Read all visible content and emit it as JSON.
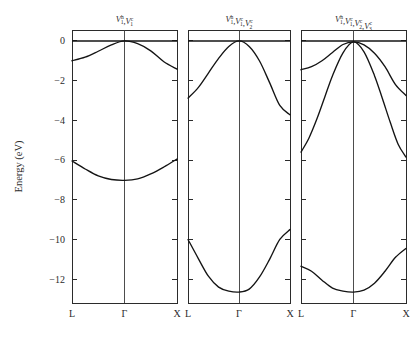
{
  "figure": {
    "ylabel": "Energy (eV)",
    "background_color": "#ffffff",
    "line_color": "#141414",
    "axis_color": "#2b2b2b"
  },
  "chart_data": {
    "type": "line",
    "title": "",
    "xlabel": "",
    "ylabel": "Energy (eV)",
    "ylim": [
      -13.2,
      0.55
    ],
    "yticks": [
      0,
      -2,
      -4,
      -6,
      -8,
      -10,
      -12
    ],
    "yticklabels": [
      "0",
      "-2",
      "-4",
      "-6",
      "-8",
      "-10",
      "-12"
    ],
    "xticks": [
      0,
      1,
      2
    ],
    "xticklabels": [
      "L",
      "Γ",
      "X"
    ],
    "grid": false,
    "legend": "none",
    "panels": [
      {
        "id": "panel-1",
        "title_parts": [
          {
            "sym": "V",
            "sup": "h",
            "sub": "1"
          },
          {
            "sym": "V",
            "sup": "c",
            "sub": "1"
          }
        ],
        "title_text": "V1h,V1c",
        "series": [
          {
            "name": "flat-band",
            "x": [
              0,
              1,
              2
            ],
            "values": [
              0.0,
              0.0,
              0.0
            ]
          },
          {
            "name": "upper-valence-band",
            "x": [
              0,
              0.25,
              0.5,
              0.75,
              1,
              1.25,
              1.5,
              1.75,
              2
            ],
            "values": [
              -1.0,
              -0.82,
              -0.52,
              -0.2,
              0.0,
              -0.14,
              -0.5,
              -1.05,
              -1.42
            ]
          },
          {
            "name": "lower-valence-band",
            "x": [
              0,
              0.25,
              0.5,
              0.75,
              1,
              1.25,
              1.5,
              1.75,
              2
            ],
            "values": [
              -6.05,
              -6.45,
              -6.8,
              -6.98,
              -7.02,
              -6.95,
              -6.7,
              -6.35,
              -5.95
            ]
          }
        ]
      },
      {
        "id": "panel-2",
        "title_parts": [
          {
            "sym": "V",
            "sup": "h",
            "sub": "1"
          },
          {
            "sym": "V",
            "sup": "c",
            "sub": "1"
          },
          {
            "sym": "V",
            "sup": "c",
            "sub": "2"
          }
        ],
        "title_text": "V1h,V1c,V2c",
        "series": [
          {
            "name": "flat-band",
            "x": [
              0,
              1,
              2
            ],
            "values": [
              0.0,
              0.0,
              0.0
            ]
          },
          {
            "name": "upper-valence-band",
            "x": [
              0,
              0.2,
              0.4,
              0.6,
              0.8,
              1,
              1.2,
              1.4,
              1.6,
              1.8,
              2
            ],
            "values": [
              -2.88,
              -2.35,
              -1.62,
              -0.88,
              -0.28,
              0.0,
              -0.28,
              -1.0,
              -2.1,
              -3.25,
              -3.72
            ]
          },
          {
            "name": "lower-valence-band",
            "x": [
              0,
              0.2,
              0.4,
              0.6,
              0.8,
              1,
              1.2,
              1.4,
              1.6,
              1.8,
              2
            ],
            "values": [
              -10.0,
              -10.95,
              -11.85,
              -12.4,
              -12.6,
              -12.65,
              -12.5,
              -11.9,
              -11.0,
              -10.0,
              -9.5
            ]
          }
        ]
      },
      {
        "id": "panel-3",
        "title_parts": [
          {
            "sym": "V",
            "sup": "h",
            "sub": "1"
          },
          {
            "sym": "V",
            "sup": "c",
            "sub": "1"
          },
          {
            "sym": "V",
            "sup": "c",
            "sub": "2"
          },
          {
            "sym": "V",
            "sup": "c",
            "sub": "3"
          }
        ],
        "title_text": "V1h,V1c,V2c,V3c",
        "series": [
          {
            "name": "flat-band",
            "x": [
              0,
              1,
              2
            ],
            "values": [
              0.0,
              0.0,
              0.0
            ]
          },
          {
            "name": "broad-valence-band",
            "x": [
              0,
              0.2,
              0.4,
              0.6,
              0.8,
              1,
              1.2,
              1.4,
              1.6,
              1.8,
              2
            ],
            "values": [
              -1.45,
              -1.3,
              -1.0,
              -0.58,
              -0.18,
              -0.05,
              -0.2,
              -0.62,
              -1.3,
              -2.2,
              -2.75
            ]
          },
          {
            "name": "steep-valence-band",
            "x": [
              0,
              0.15,
              0.3,
              0.45,
              0.6,
              0.8,
              1,
              1.2,
              1.4,
              1.55,
              1.7,
              1.85,
              2
            ],
            "values": [
              -5.6,
              -4.9,
              -3.95,
              -2.85,
              -1.75,
              -0.6,
              -0.05,
              -0.55,
              -1.75,
              -2.9,
              -4.1,
              -5.2,
              -5.85
            ]
          },
          {
            "name": "lower-valence-band",
            "x": [
              0,
              0.2,
              0.4,
              0.6,
              0.8,
              1,
              1.2,
              1.4,
              1.6,
              1.8,
              2
            ],
            "values": [
              -11.35,
              -11.6,
              -12.05,
              -12.45,
              -12.6,
              -12.65,
              -12.55,
              -12.2,
              -11.6,
              -10.9,
              -10.45
            ]
          }
        ]
      }
    ]
  }
}
